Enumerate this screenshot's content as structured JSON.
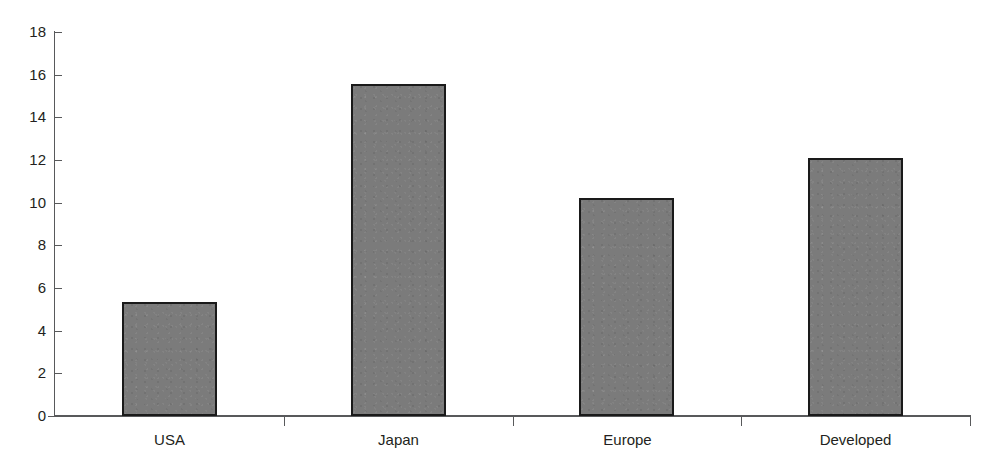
{
  "chart_data": {
    "type": "bar",
    "title": "",
    "subtitle": "",
    "xlabel": "",
    "ylabel": "",
    "categories": [
      "USA",
      "Japan",
      "Europe",
      "Developed"
    ],
    "values": [
      5.35,
      15.55,
      10.2,
      12.1
    ],
    "series": [
      {
        "name": "",
        "values": [
          5.35,
          15.55,
          10.2,
          12.1
        ]
      }
    ],
    "ylim": [
      0,
      18
    ],
    "yticks": [
      0,
      2,
      4,
      6,
      8,
      10,
      12,
      14,
      16,
      18
    ],
    "ytick_labels": [
      "0",
      "2",
      "4",
      "6",
      "8",
      "10",
      "12",
      "14",
      "16",
      "18"
    ],
    "grid": false,
    "legend": false,
    "legend_position": "none",
    "annotations": [],
    "colors": {
      "bar_fill": "#7b7b7b",
      "bar_edge": "#1a1a1a",
      "axis": "#58595b",
      "text": "#231f20",
      "background": "#ffffff"
    }
  }
}
